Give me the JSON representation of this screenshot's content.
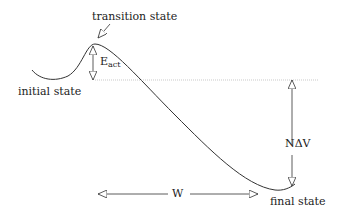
{
  "labels": {
    "transition_state": "transition state",
    "initial_state": "initial state",
    "final_state": "final state",
    "activation_energy_main": "E",
    "activation_energy_sub": "act",
    "energy_difference": "NΔV",
    "work": "W"
  },
  "colors": {
    "line": "#333333",
    "dotted": "#bbbbbb",
    "text": "#222222"
  }
}
